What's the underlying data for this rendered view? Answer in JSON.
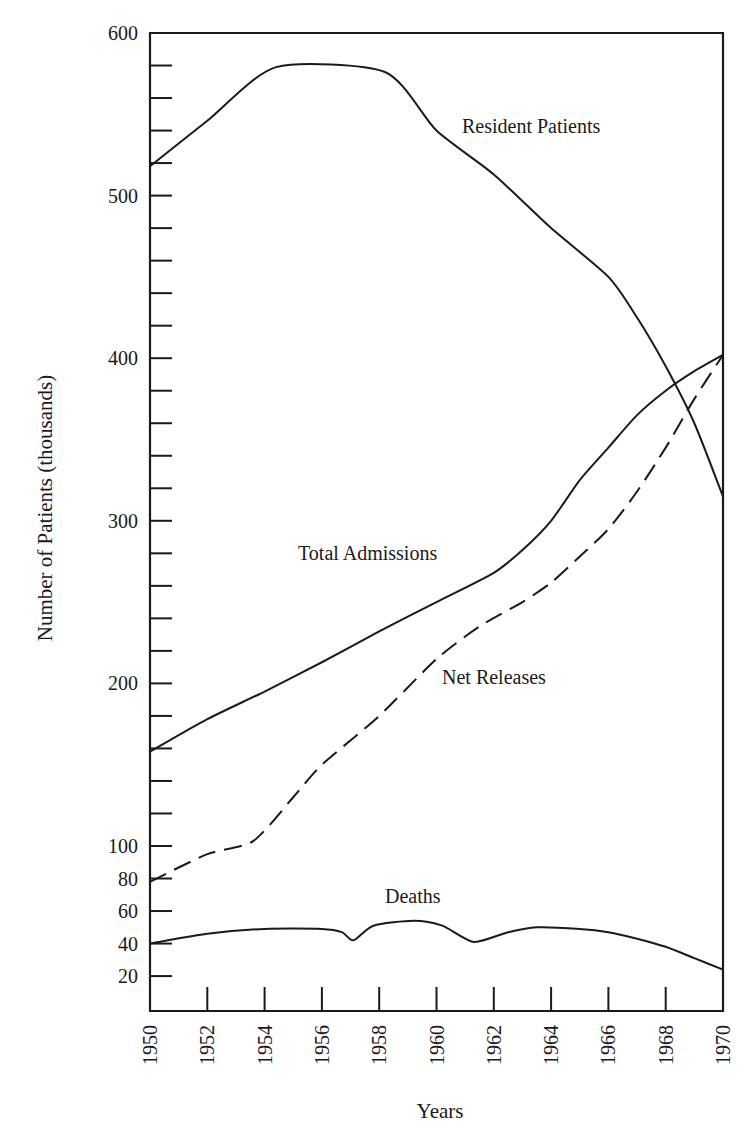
{
  "chart_data": {
    "type": "line",
    "title": "",
    "xlabel": "Years",
    "ylabel": "Number of Patients (thousands)",
    "xlim": [
      1950,
      1970
    ],
    "ylim": [
      0,
      600
    ],
    "grid": false,
    "legend": "inline labels",
    "x_ticks": [
      1950,
      1952,
      1954,
      1956,
      1958,
      1960,
      1962,
      1964,
      1966,
      1968,
      1970
    ],
    "y_tick_labels": [
      20,
      40,
      60,
      80,
      100,
      200,
      300,
      400,
      500,
      600
    ],
    "y_minor_step": 20,
    "series": [
      {
        "name": "Resident Patients",
        "style": "solid",
        "x": [
          1950,
          1952,
          1954.4,
          1958.2,
          1960,
          1962,
          1964,
          1966,
          1967,
          1968,
          1969,
          1970
        ],
        "values": [
          518,
          546,
          579,
          576,
          540,
          513,
          480,
          450,
          425,
          395,
          360,
          315
        ],
        "label_pos": {
          "x": 462,
          "y": 133
        }
      },
      {
        "name": "Total Admissions",
        "style": "solid",
        "x": [
          1950,
          1952,
          1954,
          1956,
          1958,
          1960,
          1962,
          1963,
          1964,
          1965,
          1966,
          1967,
          1968,
          1969,
          1970
        ],
        "values": [
          158,
          178,
          195,
          213,
          232,
          250,
          268,
          282,
          300,
          325,
          345,
          365,
          380,
          392,
          402
        ],
        "label_pos": {
          "x": 298,
          "y": 560
        }
      },
      {
        "name": "Net Releases",
        "style": "dashed",
        "x": [
          1950,
          1952,
          1953.6,
          1955,
          1956,
          1958,
          1960,
          1961.5,
          1963,
          1964,
          1965,
          1966,
          1967,
          1968,
          1969,
          1970
        ],
        "values": [
          78,
          95,
          103,
          130,
          150,
          180,
          215,
          235,
          250,
          262,
          278,
          295,
          318,
          345,
          375,
          402
        ],
        "label_pos": {
          "x": 442,
          "y": 684
        }
      },
      {
        "name": "Deaths",
        "style": "solid",
        "x": [
          1950,
          1952,
          1954,
          1956,
          1956.7,
          1957.1,
          1957.8,
          1959.2,
          1960.2,
          1961.3,
          1962.5,
          1963.5,
          1965,
          1966,
          1967,
          1968,
          1969,
          1970
        ],
        "values": [
          40,
          46,
          49,
          49,
          47,
          42,
          51,
          54,
          51,
          41,
          47,
          50,
          49,
          47,
          43,
          38,
          31,
          24
        ],
        "label_pos": {
          "x": 385,
          "y": 903
        }
      }
    ]
  }
}
